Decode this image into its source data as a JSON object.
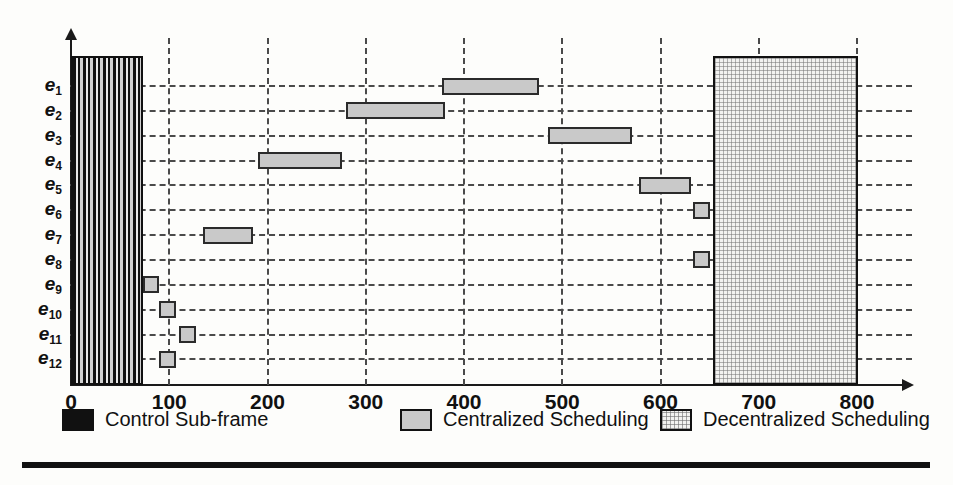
{
  "chart_data": {
    "type": "bar",
    "subtype": "gantt-horizontal-ranges",
    "title": "",
    "xlabel": "",
    "ylabel": "",
    "xlim": [
      0,
      830
    ],
    "ylim_categories": [
      "e1",
      "e2",
      "e3",
      "e4",
      "e5",
      "e6",
      "e7",
      "e8",
      "e9",
      "e10",
      "e11",
      "e12"
    ],
    "grid": "dashed horizontal per category, dashed vertical per 100 units",
    "xticks": [
      0,
      100,
      200,
      300,
      400,
      500,
      600,
      700,
      800
    ],
    "xtick_labels": [
      "0",
      "100",
      "200",
      "300",
      "400",
      "500",
      "600",
      "700",
      "800"
    ],
    "ytick_labels": [
      "e₁",
      "e₂",
      "e₃",
      "e₄",
      "e₅",
      "e₆",
      "e₇",
      "e₈",
      "e₉",
      "e₁₀",
      "e₁₁",
      "e₁₂"
    ],
    "regions": [
      {
        "name": "Control Sub-frame",
        "start": 0,
        "end": 73,
        "fill": "control"
      },
      {
        "name": "Decentralized Scheduling",
        "start": 653,
        "end": 801,
        "fill": "decentralized"
      }
    ],
    "tasks": [
      {
        "label": "e1",
        "start": 378,
        "end": 476
      },
      {
        "label": "e2",
        "start": 280,
        "end": 381
      },
      {
        "label": "e3",
        "start": 486,
        "end": 571
      },
      {
        "label": "e4",
        "start": 190,
        "end": 276
      },
      {
        "label": "e5",
        "start": 578,
        "end": 631
      },
      {
        "label": "e6",
        "start": 633,
        "end": 650
      },
      {
        "label": "e7",
        "start": 134,
        "end": 185
      },
      {
        "label": "e8",
        "start": 633,
        "end": 650
      },
      {
        "label": "e9",
        "start": 73,
        "end": 90
      },
      {
        "label": "e10",
        "start": 90,
        "end": 107
      },
      {
        "label": "e11",
        "start": 110,
        "end": 127
      },
      {
        "label": "e12",
        "start": 90,
        "end": 107
      }
    ],
    "legend": {
      "position": "below-axis",
      "entries": [
        {
          "label": "Control Sub-frame",
          "swatch": "control",
          "color": "#111111"
        },
        {
          "label": "Centralized Scheduling",
          "swatch": "centralized",
          "color": "#c9c9c9"
        },
        {
          "label": "Decentralized Scheduling",
          "swatch": "decentralized",
          "color": "#f2f2f0"
        }
      ]
    }
  },
  "axis": {
    "x_ticks": [
      "0",
      "100",
      "200",
      "300",
      "400",
      "500",
      "600",
      "700",
      "800"
    ],
    "y_labels": [
      {
        "base": "e",
        "sub": "1"
      },
      {
        "base": "e",
        "sub": "2"
      },
      {
        "base": "e",
        "sub": "3"
      },
      {
        "base": "e",
        "sub": "4"
      },
      {
        "base": "e",
        "sub": "5"
      },
      {
        "base": "e",
        "sub": "6"
      },
      {
        "base": "e",
        "sub": "7"
      },
      {
        "base": "e",
        "sub": "8"
      },
      {
        "base": "e",
        "sub": "9"
      },
      {
        "base": "e",
        "sub": "10"
      },
      {
        "base": "e",
        "sub": "11"
      },
      {
        "base": "e",
        "sub": "12"
      }
    ]
  },
  "legend": {
    "items": [
      {
        "label": "Control Sub-frame",
        "kind": "control"
      },
      {
        "label": "Centralized Scheduling",
        "kind": "centralized"
      },
      {
        "label": "Decentralized Scheduling",
        "kind": "decentralized"
      }
    ]
  }
}
